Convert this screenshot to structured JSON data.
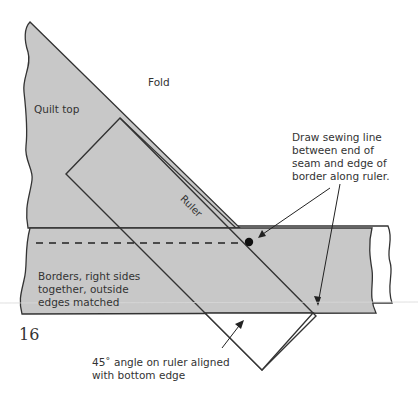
{
  "labels": {
    "fold": "Fold",
    "quilt_top": "Quilt top",
    "ruler": "Ruler",
    "sewing_line_note": "Draw sewing line\nbetween end of\nseam and edge of\nborder along ruler.",
    "borders_note": "Borders, right sides\ntogether, outside\nedges matched",
    "angle_note": "45˚ angle on ruler aligned\nwith bottom edge",
    "page_number": "16"
  },
  "colors": {
    "fabric_fill": "#c8c8c8",
    "outline": "#333333",
    "background": "#ffffff"
  }
}
